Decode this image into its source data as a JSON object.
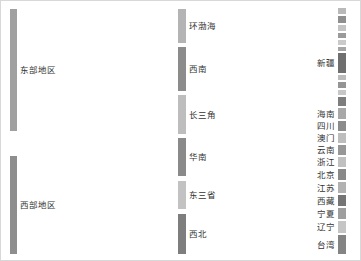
{
  "chart_data": {
    "type": "sankey",
    "title": "",
    "orientation": "horizontal",
    "background": "#ffffff",
    "border_color": "#d8d8d8",
    "link_color": "#cfcfcf",
    "link_opacity": 0.62,
    "columns": [
      {
        "name": "region",
        "x": 9,
        "width": 7
      },
      {
        "name": "subregion",
        "x": 177,
        "width": 8
      },
      {
        "name": "province",
        "x": 337,
        "width": 8
      }
    ],
    "nodes": [
      {
        "id": "east",
        "label": "东部地区",
        "col": 0,
        "y": 8,
        "h": 122,
        "color": "#a0a0a0",
        "value": 122,
        "label_pos": "right"
      },
      {
        "id": "west",
        "label": "西部地区",
        "col": 0,
        "y": 155,
        "h": 98,
        "color": "#8e8e8e",
        "value": 98,
        "label_pos": "right"
      },
      {
        "id": "bohai",
        "label": "环渤海",
        "col": 1,
        "y": 8,
        "h": 34,
        "color": "#b4b4b4",
        "value": 34,
        "label_pos": "right"
      },
      {
        "id": "sw",
        "label": "西南",
        "col": 1,
        "y": 46,
        "h": 44,
        "color": "#8c8c8c",
        "value": 44,
        "label_pos": "right"
      },
      {
        "id": "yrd",
        "label": "长三角",
        "col": 1,
        "y": 94,
        "h": 39,
        "color": "#bdbdbd",
        "value": 39,
        "label_pos": "right"
      },
      {
        "id": "south",
        "label": "华南",
        "col": 1,
        "y": 137,
        "h": 38,
        "color": "#8a8a8a",
        "value": 38,
        "label_pos": "right"
      },
      {
        "id": "ne3",
        "label": "东三省",
        "col": 1,
        "y": 180,
        "h": 28,
        "color": "#c2c2c2",
        "value": 28,
        "label_pos": "right"
      },
      {
        "id": "nw",
        "label": "西北",
        "col": 1,
        "y": 213,
        "h": 40,
        "color": "#7e7e7e",
        "value": 40,
        "label_pos": "right"
      },
      {
        "id": "p1",
        "label": "",
        "col": 2,
        "y": 7,
        "h": 6,
        "color": "#b9b9b9",
        "value": 6,
        "label_pos": "right"
      },
      {
        "id": "p2",
        "label": "",
        "col": 2,
        "y": 15,
        "h": 7,
        "color": "#8f8f8f",
        "value": 7,
        "label_pos": "right"
      },
      {
        "id": "p3",
        "label": "",
        "col": 2,
        "y": 24,
        "h": 6,
        "color": "#c4c4c4",
        "value": 6,
        "label_pos": "right"
      },
      {
        "id": "p4",
        "label": "",
        "col": 2,
        "y": 32,
        "h": 5,
        "color": "#9a9a9a",
        "value": 5,
        "label_pos": "right"
      },
      {
        "id": "p5",
        "label": "",
        "col": 2,
        "y": 39,
        "h": 5,
        "color": "#cacaca",
        "value": 5,
        "label_pos": "right"
      },
      {
        "id": "p6",
        "label": "",
        "col": 2,
        "y": 46,
        "h": 4,
        "color": "#a5a5a5",
        "value": 4,
        "label_pos": "right"
      },
      {
        "id": "xj",
        "label": "新疆",
        "col": 2,
        "y": 52,
        "h": 20,
        "color": "#6f6f6f",
        "value": 20,
        "label_pos": "left"
      },
      {
        "id": "p8",
        "label": "",
        "col": 2,
        "y": 74,
        "h": 5,
        "color": "#bcbcbc",
        "value": 5,
        "label_pos": "right"
      },
      {
        "id": "p9",
        "label": "",
        "col": 2,
        "y": 81,
        "h": 6,
        "color": "#949494",
        "value": 6,
        "label_pos": "right"
      },
      {
        "id": "p10",
        "label": "",
        "col": 2,
        "y": 89,
        "h": 5,
        "color": "#c7c7c7",
        "value": 5,
        "label_pos": "right"
      },
      {
        "id": "p11",
        "label": "",
        "col": 2,
        "y": 96,
        "h": 9,
        "color": "#7d7d7d",
        "value": 9,
        "label_pos": "right"
      },
      {
        "id": "hn",
        "label": "海南",
        "col": 2,
        "y": 107,
        "h": 11,
        "color": "#a8a8a8",
        "value": 11,
        "label_pos": "left"
      },
      {
        "id": "sc",
        "label": "四川",
        "col": 2,
        "y": 120,
        "h": 10,
        "color": "#8b8b8b",
        "value": 10,
        "label_pos": "left"
      },
      {
        "id": "mo",
        "label": "澳门",
        "col": 2,
        "y": 132,
        "h": 10,
        "color": "#bdbdbd",
        "value": 10,
        "label_pos": "left"
      },
      {
        "id": "yn",
        "label": "云南",
        "col": 2,
        "y": 144,
        "h": 10,
        "color": "#979797",
        "value": 10,
        "label_pos": "left"
      },
      {
        "id": "zj",
        "label": "浙江",
        "col": 2,
        "y": 156,
        "h": 10,
        "color": "#c0c0c0",
        "value": 10,
        "label_pos": "left"
      },
      {
        "id": "bj",
        "label": "北京",
        "col": 2,
        "y": 168,
        "h": 11,
        "color": "#898989",
        "value": 11,
        "label_pos": "left"
      },
      {
        "id": "js",
        "label": "江苏",
        "col": 2,
        "y": 181,
        "h": 11,
        "color": "#b2b2b2",
        "value": 11,
        "label_pos": "left"
      },
      {
        "id": "xz",
        "label": "西藏",
        "col": 2,
        "y": 194,
        "h": 11,
        "color": "#757575",
        "value": 11,
        "label_pos": "left"
      },
      {
        "id": "nx",
        "label": "宁夏",
        "col": 2,
        "y": 207,
        "h": 11,
        "color": "#9e9e9e",
        "value": 11,
        "label_pos": "left"
      },
      {
        "id": "ln",
        "label": "辽宁",
        "col": 2,
        "y": 220,
        "h": 12,
        "color": "#c5c5c5",
        "value": 12,
        "label_pos": "left"
      },
      {
        "id": "tw",
        "label": "台湾",
        "col": 2,
        "y": 234,
        "h": 19,
        "color": "#848484",
        "value": 19,
        "label_pos": "left"
      }
    ],
    "links": [
      {
        "source": "east",
        "target": "bohai",
        "value": 34,
        "sy": 8,
        "ty": 8
      },
      {
        "source": "east",
        "target": "yrd",
        "value": 39,
        "sy": 42,
        "ty": 94
      },
      {
        "source": "east",
        "target": "south",
        "value": 38,
        "sy": 81,
        "ty": 137
      },
      {
        "source": "east",
        "target": "ne3",
        "value": 11,
        "sy": 119,
        "ty": 180
      },
      {
        "source": "west",
        "target": "sw",
        "value": 44,
        "sy": 155,
        "ty": 46
      },
      {
        "source": "west",
        "target": "ne3",
        "value": 17,
        "sy": 199,
        "ty": 191
      },
      {
        "source": "west",
        "target": "nw",
        "value": 37,
        "sy": 216,
        "ty": 213
      },
      {
        "source": "bohai",
        "target": "p1",
        "value": 6,
        "sy": 8,
        "ty": 7
      },
      {
        "source": "bohai",
        "target": "p3",
        "value": 6,
        "sy": 14,
        "ty": 24
      },
      {
        "source": "bohai",
        "target": "bj",
        "value": 11,
        "sy": 20,
        "ty": 168
      },
      {
        "source": "bohai",
        "target": "ln",
        "value": 11,
        "sy": 31,
        "ty": 220
      },
      {
        "source": "sw",
        "target": "sc",
        "value": 10,
        "sy": 46,
        "ty": 120
      },
      {
        "source": "sw",
        "target": "yn",
        "value": 10,
        "sy": 56,
        "ty": 144
      },
      {
        "source": "sw",
        "target": "xz",
        "value": 11,
        "sy": 66,
        "ty": 194
      },
      {
        "source": "sw",
        "target": "p9",
        "value": 6,
        "sy": 77,
        "ty": 81
      },
      {
        "source": "sw",
        "target": "p4",
        "value": 5,
        "sy": 83,
        "ty": 32
      },
      {
        "source": "yrd",
        "target": "zj",
        "value": 10,
        "sy": 94,
        "ty": 156
      },
      {
        "source": "yrd",
        "target": "js",
        "value": 11,
        "sy": 104,
        "ty": 181
      },
      {
        "source": "yrd",
        "target": "p2",
        "value": 7,
        "sy": 115,
        "ty": 15
      },
      {
        "source": "yrd",
        "target": "p8",
        "value": 5,
        "sy": 122,
        "ty": 74
      },
      {
        "source": "yrd",
        "target": "p5",
        "value": 5,
        "sy": 127,
        "ty": 39
      },
      {
        "source": "south",
        "target": "hn",
        "value": 11,
        "sy": 137,
        "ty": 107
      },
      {
        "source": "south",
        "target": "mo",
        "value": 10,
        "sy": 148,
        "ty": 132
      },
      {
        "source": "south",
        "target": "tw",
        "value": 12,
        "sy": 158,
        "ty": 234
      },
      {
        "source": "south",
        "target": "p6",
        "value": 4,
        "sy": 170,
        "ty": 46
      },
      {
        "source": "ne3",
        "target": "p10",
        "value": 5,
        "sy": 180,
        "ty": 89
      },
      {
        "source": "ne3",
        "target": "p11",
        "value": 9,
        "sy": 185,
        "ty": 96
      },
      {
        "source": "ne3",
        "target": "tw",
        "value": 7,
        "sy": 194,
        "ty": 246
      },
      {
        "source": "ne3",
        "target": "p1",
        "value": 6,
        "sy": 201,
        "ty": 7
      },
      {
        "source": "nw",
        "target": "xj",
        "value": 20,
        "sy": 213,
        "ty": 52
      },
      {
        "source": "nw",
        "target": "nx",
        "value": 11,
        "sy": 233,
        "ty": 207
      },
      {
        "source": "nw",
        "target": "p3",
        "value": 5,
        "sy": 244,
        "ty": 27
      },
      {
        "source": "nw",
        "target": "p9",
        "value": 4,
        "sy": 249,
        "ty": 85
      }
    ]
  }
}
